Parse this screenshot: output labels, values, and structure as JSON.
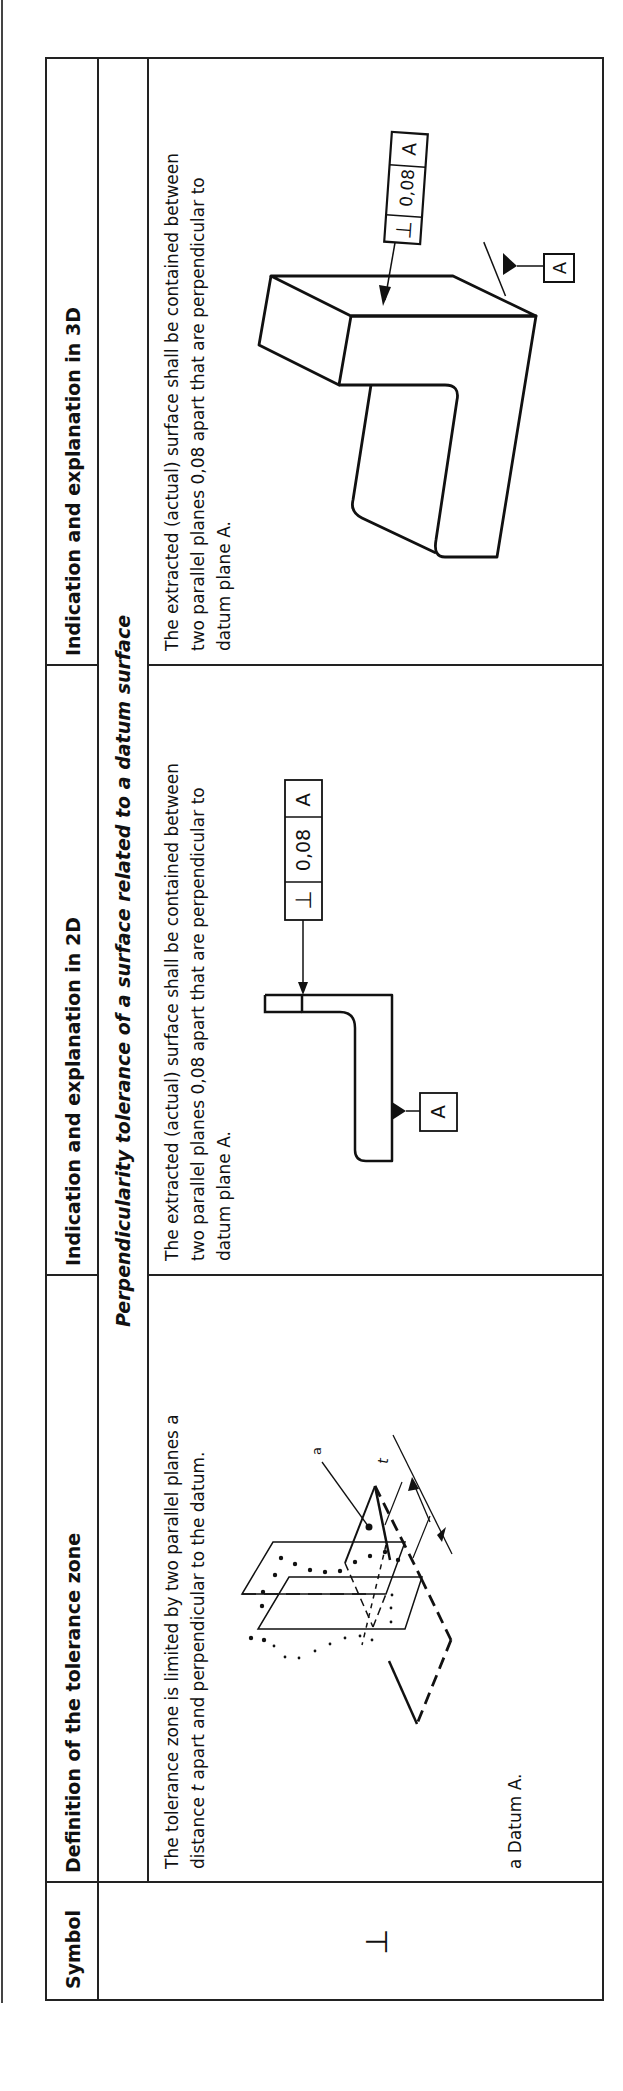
{
  "table": {
    "headers": {
      "symbol": "Symbol",
      "definition": "Definition of the tolerance zone",
      "indication_2d": "Indication and explanation in 2D",
      "indication_3d": "Indication and explanation in 3D"
    },
    "section_title": "Perpendicularity tolerance of a surface related to a datum surface",
    "row": {
      "symbol": "⊥",
      "definition_text_line1": "The tolerance zone is limited by two parallel planes a",
      "definition_text_line2_pre": "distance ",
      "definition_text_line2_italic": "t",
      "definition_text_line2_post": " apart and perpendicular to the datum.",
      "definition_footnote": "a Datum A.",
      "definition_diagram": {
        "label_a": "a",
        "label_t": "t"
      },
      "explanation_2d": {
        "line1": "The extracted (actual) surface shall be contained between",
        "line2": "two parallel planes 0,08 apart that are perpendicular to",
        "line3": "datum plane A.",
        "frame_symbol": "⊥",
        "frame_value": "0,08",
        "frame_datum": "A",
        "datum_label": "A"
      },
      "explanation_3d": {
        "line1": "The extracted (actual) surface shall be contained between",
        "line2": "two parallel planes 0,08 apart that are perpendicular to",
        "line3": "datum plane A.",
        "frame_symbol": "⊥",
        "frame_value": "0,08",
        "frame_datum": "A",
        "datum_label": "A"
      }
    }
  }
}
